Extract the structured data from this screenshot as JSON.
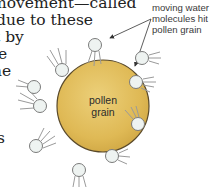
{
  "body_text": {
    "lines": [
      {
        "text": "movement—called",
        "x": -8,
        "y": -4
      },
      {
        "text": "due to these",
        "x": -4,
        "y": 13
      },
      {
        "text": "t by",
        "x": -2,
        "y": 30
      },
      {
        "text": "e",
        "x": -2,
        "y": 47
      },
      {
        "text": "ne",
        "x": -4,
        "y": 64
      },
      {
        "text": "s",
        "x": -1,
        "y": 131
      }
    ]
  },
  "diagram": {
    "pollen_grain": {
      "label_line1": "pollen",
      "label_line2": "grain",
      "fill": "#e1bc55",
      "stroke": "#5a4a2a"
    },
    "callout": {
      "line1": "moving water",
      "line2": "molecules hit",
      "line3": "pollen grain"
    },
    "water_molecule": {
      "fill": "#eef3f1",
      "stroke": "#7a7a7a",
      "motion_line_color": "#9a9a9a"
    },
    "arrow_color": "#333333"
  }
}
